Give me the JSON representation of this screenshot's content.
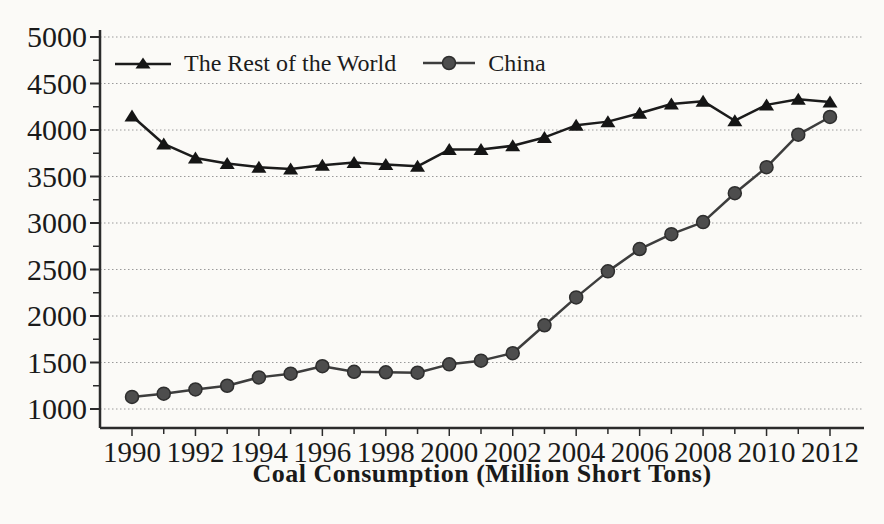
{
  "chart_data": {
    "type": "line",
    "title": "",
    "xlabel": "Coal Consumption (Million Short Tons)",
    "ylabel": "",
    "x": [
      1990,
      1991,
      1992,
      1993,
      1994,
      1995,
      1996,
      1997,
      1998,
      1999,
      2000,
      2001,
      2002,
      2003,
      2004,
      2005,
      2006,
      2007,
      2008,
      2009,
      2010,
      2011,
      2012
    ],
    "series": [
      {
        "name": "The Rest of the World",
        "marker": "triangle",
        "line_color": "#1b1b1b",
        "marker_color": "#151515",
        "values": [
          4150,
          3850,
          3700,
          3640,
          3600,
          3580,
          3620,
          3650,
          3630,
          3610,
          3790,
          3790,
          3830,
          3920,
          4050,
          4090,
          4180,
          4280,
          4310,
          4100,
          4270,
          4330,
          4300
        ]
      },
      {
        "name": "China",
        "marker": "circle",
        "line_color": "#3d3d3d",
        "marker_color": "#4d4d4d",
        "marker_edge_color": "#2e2e2e",
        "values": [
          1130,
          1165,
          1210,
          1250,
          1340,
          1380,
          1460,
          1400,
          1395,
          1390,
          1480,
          1520,
          1600,
          1900,
          2200,
          2480,
          2720,
          2880,
          3010,
          3320,
          3600,
          3950,
          4140
        ]
      }
    ],
    "ylim": [
      1000,
      5000
    ],
    "y_ticks": [
      1000,
      1500,
      2000,
      2500,
      3000,
      3500,
      4000,
      4500,
      5000
    ],
    "y_minor_tick_step": 250,
    "x_tick_labels": [
      "1990",
      "1992",
      "1994",
      "1996",
      "1998",
      "2000",
      "2002",
      "2004",
      "2006",
      "2008",
      "2010",
      "2012"
    ],
    "x_minor_tick_step_years": 1,
    "grid": "horizontal-dotted",
    "legend_position": "top-inside",
    "axis_color": "#2b2b2b",
    "tick_label_color": "#1a1a1a",
    "grid_color": "#9a9a9a",
    "background": "#fbfaf7"
  }
}
